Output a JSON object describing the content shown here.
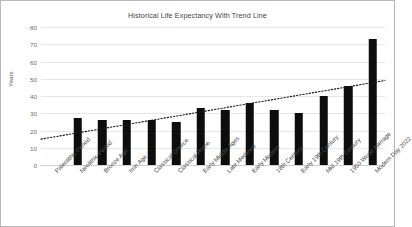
{
  "chart_data": {
    "type": "bar",
    "title": "Historical Life Expectancy With Trend Line",
    "xlabel": "",
    "ylabel": "Years",
    "ylim": [
      0,
      80
    ],
    "ytick_step": 10,
    "ytick_labels": [
      "80",
      "70",
      "60",
      "50",
      "40",
      "30",
      "20",
      "10",
      "0"
    ],
    "grid": true,
    "legend": false,
    "categories": [
      "Paleolithic Period",
      "Neolithic Period",
      "Bronze Age",
      "Iron Age",
      "Classical Greece",
      "Classical Rome",
      "Early Middle Ages",
      "Late Medieval",
      "Early Modern",
      "18th Century",
      "Early 19th Century",
      "Mid 19th Century",
      "1950 World Average",
      "Modern Day 2022"
    ],
    "values": [
      0,
      27,
      26,
      26,
      26,
      25,
      33,
      32,
      36,
      32,
      30,
      40,
      46,
      73
    ],
    "bar_color": "#0d0d0d",
    "series": [
      {
        "name": "Life Expectancy",
        "values": [
          0,
          27,
          26,
          26,
          26,
          25,
          33,
          32,
          36,
          32,
          30,
          40,
          46,
          73
        ]
      }
    ],
    "trendline": {
      "type": "linear",
      "style": "dotted",
      "color": "#1a1a1a",
      "start_value": 15,
      "end_value": 49
    },
    "annotations": []
  },
  "colors": {
    "bar": "#0d0d0d",
    "grid": "#e6e6e6",
    "border": "#b9b9b9",
    "title_text": "#3f3f3f",
    "tick_text": "#6e6e6e",
    "label_text": "#4a4a4a"
  }
}
